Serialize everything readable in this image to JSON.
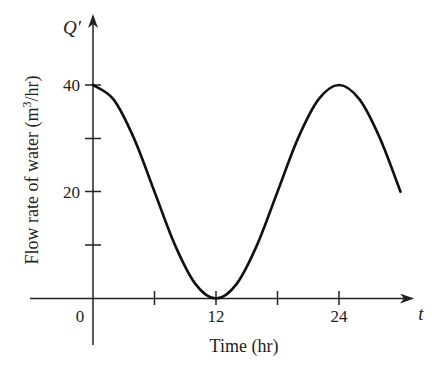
{
  "chart_data": {
    "type": "line",
    "title": "",
    "xlabel": "Time (hr)",
    "ylabel": "Flow rate of water (m³/hr)",
    "ylabel_parts": {
      "before": "Flow rate of water (m",
      "sup": "3",
      "after": "/hr)"
    },
    "x_axis_symbol": "t",
    "y_axis_symbol": "Q′",
    "xlim": [
      0,
      30
    ],
    "ylim": [
      0,
      40
    ],
    "x_ticks": [
      0,
      6,
      12,
      18,
      24
    ],
    "x_tick_labels": [
      "0",
      "",
      "12",
      "",
      "24"
    ],
    "y_ticks": [
      10,
      20,
      30,
      40
    ],
    "y_tick_labels": [
      "",
      "20",
      "",
      "40"
    ],
    "grid": false,
    "legend": null,
    "formula": "Q'(t) = 20 + 20 cos(πt/12)",
    "series": [
      {
        "name": "Flow rate",
        "x": [
          0,
          2,
          4,
          6,
          8,
          10,
          12,
          14,
          16,
          18,
          20,
          22,
          24,
          26,
          28,
          30
        ],
        "values": [
          40,
          37.3,
          30,
          20,
          10,
          2.7,
          0,
          2.7,
          10,
          20,
          30,
          37.3,
          40,
          37.3,
          30,
          20
        ]
      }
    ]
  },
  "labels": {
    "origin": "0",
    "x12": "12",
    "x24": "24",
    "y20": "20",
    "y40": "40",
    "t": "t",
    "q": "Q′",
    "xtitle": "Time (hr)",
    "ytitle_before": "Flow rate of water (m",
    "ytitle_sup": "3",
    "ytitle_after": "/hr)"
  },
  "colors": {
    "line": "#111111",
    "axis": "#222222"
  }
}
